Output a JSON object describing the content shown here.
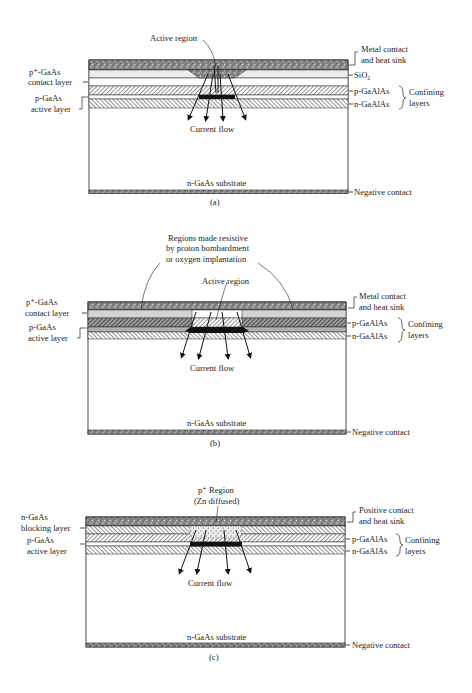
{
  "figure": {
    "panels": [
      {
        "id": "a",
        "caption": "(a)",
        "top_callout": "Active region",
        "left_labels": {
          "contact_line1": "p⁺-GaAs",
          "contact_line2": "contact layer",
          "active_line1": "p-GaAs",
          "active_line2": "active layer"
        },
        "right_labels": {
          "top_line1": "Metal contact",
          "top_line2": "and heat sink",
          "oxide": "SiO₂",
          "p_clad": "p-GaAlAs",
          "n_clad": "n-GaAlAs",
          "confining_line1": "Confining",
          "confining_line2": "layers",
          "bottom": "Negative contact"
        },
        "current_label": "Current flow",
        "substrate_label": "n-GaAs substrate"
      },
      {
        "id": "b",
        "caption": "(b)",
        "top_callout": "Active region",
        "resistive_callout": [
          "Regions made resistive",
          "by proton bombardment",
          "or oxygen implantation"
        ],
        "left_labels": {
          "contact_line1": "p⁺-GaAs",
          "contact_line2": "contact layer",
          "active_line1": "p-GaAs",
          "active_line2": "active layer"
        },
        "right_labels": {
          "top_line1": "Metal contact",
          "top_line2": "and heat sink",
          "p_clad": "p-GaAlAs",
          "n_clad": "n-GaAlAs",
          "confining_line1": "Confining",
          "confining_line2": "layers",
          "bottom": "Negative contact"
        },
        "current_label": "Current flow",
        "substrate_label": "n-GaAs substrate"
      },
      {
        "id": "c",
        "caption": "(c)",
        "top_callout": [
          "p⁺ Region",
          "(Zn diffused)"
        ],
        "left_labels": {
          "contact_line1": "n-GaAs",
          "contact_line2": "blocking layer",
          "active_line1": "p-GaAs",
          "active_line2": "active layer"
        },
        "right_labels": {
          "top_line1": "Positive contact",
          "top_line2": "and heat sink",
          "p_clad": "p-GaAlAs",
          "n_clad": "n-GaAlAs",
          "confining_line1": "Confining",
          "confining_line2": "layers",
          "bottom": "Negative contact"
        },
        "current_label": "Current flow",
        "substrate_label": "n-GaAs substrate"
      }
    ]
  }
}
